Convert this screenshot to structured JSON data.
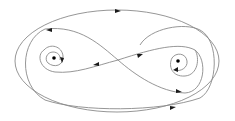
{
  "diagram": {
    "type": "phase-portrait",
    "colors": {
      "curve": "#8a8a8a",
      "arrow": "#1a1a1a",
      "point": "#000000",
      "background": "#ffffff"
    },
    "fixed_points": [
      {
        "name": "left-center",
        "x": 54,
        "y": 58
      },
      {
        "name": "right-center",
        "x": 178,
        "y": 61
      }
    ],
    "curves": [
      {
        "name": "outer-orbit",
        "kind": "ellipse"
      },
      {
        "name": "inner-orbit",
        "kind": "closed-loop"
      },
      {
        "name": "figure-eight-separatrix",
        "kind": "lemniscate"
      },
      {
        "name": "left-spiral",
        "kind": "spiral"
      },
      {
        "name": "right-spiral",
        "kind": "spiral"
      }
    ],
    "arrows": [
      {
        "name": "outer-top",
        "direction": "right"
      },
      {
        "name": "inner-top-left",
        "direction": "left"
      },
      {
        "name": "crossing-lower-left",
        "direction": "left"
      },
      {
        "name": "crossing-upper-right",
        "direction": "right"
      },
      {
        "name": "inner-lower-right",
        "direction": "right"
      },
      {
        "name": "outer-bottom",
        "direction": "right"
      },
      {
        "name": "left-spiral",
        "direction": "down"
      },
      {
        "name": "right-spiral",
        "direction": "left"
      }
    ]
  }
}
